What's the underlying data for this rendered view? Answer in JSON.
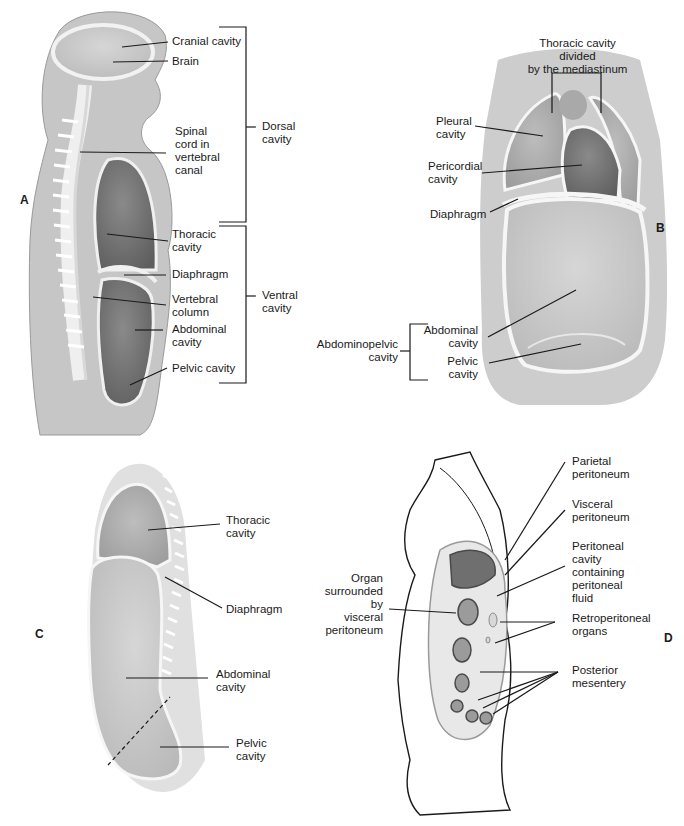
{
  "figure": {
    "panels": [
      {
        "id": "A",
        "letter": "A",
        "labels": {
          "cranial_cavity": "Cranial cavity",
          "brain": "Brain",
          "spinal_cord": "Spinal\ncord in\nvertebral\ncanal",
          "thoracic_cavity": "Thoracic\ncavity",
          "diaphragm": "Diaphragm",
          "vertebral_column": "Vertebral\ncolumn",
          "abdominal_cavity": "Abdominal\ncavity",
          "pelvic_cavity": "Pelvic cavity"
        },
        "groups": {
          "dorsal": "Dorsal\ncavity",
          "ventral": "Ventral\ncavity"
        }
      },
      {
        "id": "B",
        "letter": "B",
        "labels": {
          "title": "Thoracic cavity divided\nby the mediastinum",
          "pleural_cavity": "Pleural\ncavity",
          "pericordial_cavity": "Pericordial\ncavity",
          "diaphragm": "Diaphragm",
          "abdominal_cavity": "Abdominal\ncavity",
          "pelvic_cavity": "Pelvic\ncavity"
        },
        "groups": {
          "abdominopelvic": "Abdominopelvic\ncavity"
        }
      },
      {
        "id": "C",
        "letter": "C",
        "labels": {
          "thoracic_cavity": "Thoracic\ncavity",
          "diaphragm": "Diaphragm",
          "abdominal_cavity": "Abdominal\ncavity",
          "pelvic_cavity": "Pelvic\ncavity"
        }
      },
      {
        "id": "D",
        "letter": "D",
        "labels": {
          "parietal_peritoneum": "Parietal\nperitoneum",
          "visceral_peritoneum": "Visceral\nperitoneum",
          "peritoneal_cavity": "Peritoneal\ncavity\ncontaining\nperitoneal\nfluid",
          "organ_surrounded": "Organ\nsurrounded\nby\nvisceral\nperitoneum",
          "retroperitoneal_organs": "Retroperitoneal\norgans",
          "posterior_mesentery": "Posterior\nmesentery"
        }
      }
    ],
    "colors": {
      "label_text": "#1a1a1a",
      "body_fill": "#c9c9c9",
      "cavity_dark": "#707070",
      "cavity_mid": "#a0a0a0",
      "membrane": "#f4f4f4"
    }
  }
}
